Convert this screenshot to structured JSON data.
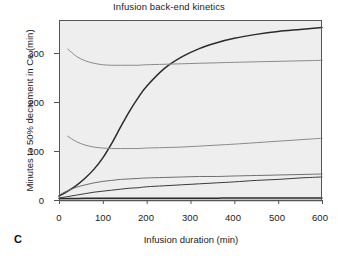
{
  "figure": {
    "panel_letter": "C",
    "title": "Infusion back-end kinetics",
    "xlabel": "Infusion duration (min)",
    "ylabel": "Minutes to 50% decrement in Ce (min)"
  },
  "axes": {
    "x_ticks": [
      "0",
      "100",
      "200",
      "300",
      "400",
      "500",
      "600"
    ],
    "y_ticks": [
      "0",
      "100",
      "200",
      "300"
    ]
  },
  "labels": {
    "fentanyl": "Fentanyl",
    "morphine": "Morphine",
    "hydromorphone": "Hydromorphone",
    "alfentanil": "Alfentanil",
    "sufentanil": "Sufentanil",
    "remifentanil": "Remifentanil"
  },
  "colors": {
    "plot_background": "#eeeeee",
    "frame": "#555555",
    "fentanyl": "#2b2b2b",
    "morphine": "#8a8a8a",
    "hydromorphone": "#8a8a8a",
    "alfentanil": "#6e6e6e",
    "sufentanil": "#3a3a3a",
    "remifentanil": "#2b2b2b",
    "text": "#1a1a1a"
  },
  "chart_data": {
    "type": "line",
    "title": "Infusion back-end kinetics",
    "xlabel": "Infusion duration (min)",
    "ylabel": "Minutes to 50% decrement in Ce (min)",
    "xlim": [
      0,
      600
    ],
    "ylim": [
      0,
      355
    ],
    "x_ticks": [
      0,
      100,
      200,
      300,
      400,
      500,
      600
    ],
    "y_ticks": [
      0,
      100,
      200,
      300
    ],
    "grid": false,
    "legend": "inline-right-labels",
    "x": [
      0,
      20,
      40,
      60,
      80,
      100,
      120,
      140,
      160,
      180,
      200,
      240,
      280,
      320,
      360,
      400,
      450,
      500,
      550,
      600
    ],
    "series": [
      {
        "name": "Fentanyl",
        "color": "#2b2b2b",
        "label_x": 500,
        "label_y": 332,
        "values": [
          8,
          18,
          30,
          45,
          63,
          86,
          115,
          148,
          180,
          208,
          232,
          268,
          292,
          309,
          321,
          330,
          338,
          344,
          348,
          352
        ]
      },
      {
        "name": "Morphine",
        "color": "#8a8a8a",
        "label_x": 500,
        "label_y": 262,
        "starts_at_x": 20,
        "values": [
          null,
          308,
          293,
          284,
          279,
          276,
          275,
          275,
          275,
          275,
          276,
          277,
          278,
          279,
          280,
          281,
          282,
          283,
          284,
          285
        ]
      },
      {
        "name": "Hydromorphone",
        "color": "#8a8a8a",
        "label_x": 450,
        "label_y": 143,
        "starts_at_x": 8,
        "values": [
          null,
          130,
          119,
          112,
          108,
          106,
          105,
          105,
          105,
          105,
          106,
          107,
          108,
          110,
          112,
          114,
          117,
          120,
          123,
          126
        ]
      },
      {
        "name": "Alfentanil",
        "color": "#6e6e6e",
        "label_x": 250,
        "label_y": 63,
        "values": [
          10,
          19,
          26,
          31,
          35,
          38,
          40,
          42,
          43,
          44,
          45,
          46,
          47,
          48,
          48,
          49,
          50,
          51,
          52,
          53
        ]
      },
      {
        "name": "Sufentanil",
        "color": "#3a3a3a",
        "label_x": 250,
        "label_y": 27,
        "values": [
          4,
          7,
          10,
          13,
          16,
          18,
          20,
          22,
          24,
          25,
          27,
          29,
          31,
          33,
          35,
          37,
          40,
          42,
          45,
          47
        ]
      },
      {
        "name": "Remifentanil",
        "color": "#2b2b2b",
        "label_x": 470,
        "label_y": 27,
        "values": [
          3,
          3.2,
          3.3,
          3.4,
          3.5,
          3.5,
          3.6,
          3.6,
          3.6,
          3.7,
          3.7,
          3.7,
          3.8,
          3.8,
          3.8,
          3.9,
          3.9,
          3.9,
          4,
          4
        ]
      }
    ]
  }
}
